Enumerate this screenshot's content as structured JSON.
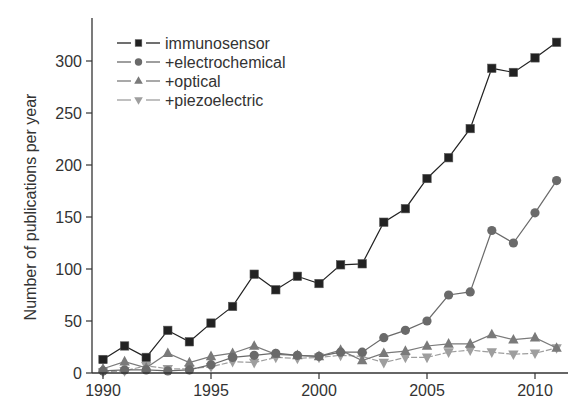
{
  "chart_data": {
    "type": "line",
    "title": "",
    "xlabel": "",
    "ylabel": "Number of publications per year",
    "xlim": [
      1989.3,
      2011.6
    ],
    "ylim": [
      0,
      335
    ],
    "x_ticks": [
      1990,
      1995,
      2000,
      2005,
      2010
    ],
    "y_ticks": [
      0,
      50,
      100,
      150,
      200,
      250,
      300
    ],
    "grid": false,
    "legend_position": "upper left",
    "x": [
      1990,
      1991,
      1992,
      1993,
      1994,
      1995,
      1996,
      1997,
      1998,
      1999,
      2000,
      2001,
      2002,
      2003,
      2004,
      2005,
      2006,
      2007,
      2008,
      2009,
      2010,
      2011
    ],
    "series": [
      {
        "name": "immunosensor",
        "marker": "square",
        "color": "#222222",
        "dashed": false,
        "values": [
          13,
          26,
          15,
          41,
          30,
          48,
          64,
          95,
          80,
          93,
          86,
          104,
          105,
          145,
          158,
          187,
          207,
          235,
          293,
          289,
          303,
          318
        ]
      },
      {
        "name": "+electrochemical",
        "marker": "circle",
        "color": "#6a6a6a",
        "dashed": false,
        "values": [
          2,
          3,
          3,
          2,
          3,
          8,
          15,
          17,
          19,
          17,
          16,
          20,
          20,
          34,
          41,
          50,
          75,
          78,
          137,
          125,
          154,
          185
        ]
      },
      {
        "name": "+optical",
        "marker": "triangle-up",
        "color": "#7a7a7a",
        "dashed": false,
        "values": [
          4,
          11,
          5,
          19,
          10,
          16,
          19,
          26,
          18,
          17,
          16,
          22,
          12,
          19,
          21,
          26,
          28,
          28,
          37,
          32,
          34,
          24
        ]
      },
      {
        "name": "+piezoelectric",
        "marker": "triangle-down",
        "color": "#9e9e9e",
        "dashed": true,
        "values": [
          1,
          2,
          7,
          4,
          4,
          6,
          11,
          10,
          15,
          14,
          15,
          17,
          16,
          10,
          15,
          15,
          20,
          22,
          20,
          18,
          19,
          24
        ]
      }
    ]
  }
}
